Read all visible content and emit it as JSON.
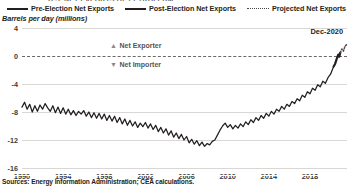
{
  "figure": {
    "unit_label": "Barrels per day (millions)",
    "source_note": "Sources: Energy Information Administration; CEA calculations.",
    "title_sliver": "U.S. NET EXPORTS OF PETROLEUM"
  },
  "legend": {
    "items": [
      {
        "label": "Pre-Election Net Exports",
        "style": "solid-thin",
        "color": "#231f20"
      },
      {
        "label": "Post-Election Net Exports",
        "style": "solid-thick",
        "color": "#231f20"
      },
      {
        "label": "Projected Net Exports",
        "style": "dotted",
        "color": "#4a4745"
      }
    ]
  },
  "annotations": {
    "net_exporter": {
      "marker": "▲",
      "label": "Net Exporter"
    },
    "net_importer": {
      "marker": "▼",
      "label": "Net Importer"
    },
    "date_label": "Dec-2020"
  },
  "chart_data": {
    "type": "line",
    "title": "",
    "xlabel": "",
    "ylabel": "Barrels per day (millions)",
    "xlim": [
      1990,
      2021.6
    ],
    "ylim": [
      -16,
      4
    ],
    "yticks": [
      4,
      0,
      -4,
      -8,
      -12,
      -16
    ],
    "xticks": [
      1990,
      1994,
      1998,
      2002,
      2006,
      2010,
      2014,
      2018
    ],
    "grid": "horizontal",
    "legend_position": "top-center",
    "zero_reference_line": 0,
    "series": [
      {
        "name": "Pre-Election Net Exports",
        "style": "solid",
        "x": [
          1990.0,
          1990.25,
          1990.5,
          1990.75,
          1991.0,
          1991.25,
          1991.5,
          1991.75,
          1992.0,
          1992.25,
          1992.5,
          1992.75,
          1993.0,
          1993.25,
          1993.5,
          1993.75,
          1994.0,
          1994.25,
          1994.5,
          1994.75,
          1995.0,
          1995.25,
          1995.5,
          1995.75,
          1996.0,
          1996.25,
          1996.5,
          1996.75,
          1997.0,
          1997.25,
          1997.5,
          1997.75,
          1998.0,
          1998.25,
          1998.5,
          1998.75,
          1999.0,
          1999.25,
          1999.5,
          1999.75,
          2000.0,
          2000.25,
          2000.5,
          2000.75,
          2001.0,
          2001.25,
          2001.5,
          2001.75,
          2002.0,
          2002.25,
          2002.5,
          2002.75,
          2003.0,
          2003.25,
          2003.5,
          2003.75,
          2004.0,
          2004.25,
          2004.5,
          2004.75,
          2005.0,
          2005.25,
          2005.5,
          2005.75,
          2006.0,
          2006.25,
          2006.5,
          2006.75,
          2007.0,
          2007.25,
          2007.5,
          2007.75,
          2008.0,
          2008.25,
          2008.5,
          2008.75,
          2009.0,
          2009.25,
          2009.5,
          2009.75,
          2010.0,
          2010.25,
          2010.5,
          2010.75,
          2011.0,
          2011.25,
          2011.5,
          2011.75,
          2012.0,
          2012.25,
          2012.5,
          2012.75,
          2013.0,
          2013.25,
          2013.5,
          2013.75,
          2014.0,
          2014.25,
          2014.5,
          2014.75,
          2015.0,
          2015.25,
          2015.5,
          2015.75,
          2016.0,
          2016.25,
          2016.5,
          2016.75,
          2017.0,
          2017.25,
          2017.5,
          2017.75,
          2018.0,
          2018.25,
          2018.5,
          2018.75,
          2019.0,
          2019.25,
          2019.5,
          2019.75,
          2020.0,
          2020.3
        ],
        "y": [
          -7.3,
          -6.6,
          -7.6,
          -6.9,
          -8.0,
          -7.1,
          -7.9,
          -7.0,
          -7.6,
          -6.8,
          -7.4,
          -7.9,
          -7.1,
          -8.1,
          -7.3,
          -8.2,
          -7.4,
          -8.3,
          -7.6,
          -8.4,
          -7.8,
          -8.5,
          -7.9,
          -8.3,
          -7.8,
          -8.6,
          -8.0,
          -8.8,
          -8.1,
          -8.9,
          -8.2,
          -9.0,
          -8.3,
          -9.2,
          -8.5,
          -9.3,
          -8.6,
          -9.5,
          -8.8,
          -9.7,
          -9.0,
          -9.9,
          -9.2,
          -10.0,
          -9.4,
          -10.2,
          -9.6,
          -10.1,
          -9.5,
          -10.3,
          -9.7,
          -10.5,
          -9.9,
          -10.8,
          -10.2,
          -11.0,
          -10.4,
          -11.3,
          -10.7,
          -11.6,
          -11.0,
          -11.8,
          -11.2,
          -12.0,
          -11.5,
          -12.4,
          -11.9,
          -12.6,
          -12.1,
          -12.8,
          -12.3,
          -12.9,
          -12.5,
          -12.7,
          -12.2,
          -12.0,
          -11.3,
          -10.6,
          -10.0,
          -9.6,
          -10.2,
          -9.8,
          -10.4,
          -9.9,
          -10.3,
          -9.7,
          -10.1,
          -9.4,
          -9.8,
          -9.1,
          -9.5,
          -8.8,
          -9.2,
          -8.5,
          -8.9,
          -8.2,
          -8.6,
          -7.9,
          -8.3,
          -7.6,
          -7.9,
          -7.2,
          -7.6,
          -6.9,
          -7.2,
          -6.5,
          -6.8,
          -6.1,
          -6.4,
          -5.6,
          -5.9,
          -5.1,
          -5.4,
          -4.6,
          -4.9,
          -4.1,
          -4.4,
          -3.6,
          -3.9,
          -3.1,
          -2.6,
          -1.5
        ]
      },
      {
        "name": "Post-Election Net Exports",
        "style": "solid",
        "x": [
          2020.3,
          2020.45,
          2020.6,
          2020.75,
          2020.85,
          2020.95
        ],
        "y": [
          -1.5,
          -1.1,
          -0.4,
          0.2,
          -0.1,
          0.5
        ]
      },
      {
        "name": "Projected Net Exports",
        "style": "dotted",
        "x": [
          2020.95,
          2021.1,
          2021.25,
          2021.4,
          2021.55
        ],
        "y": [
          0.5,
          1.0,
          0.7,
          1.4,
          1.6
        ]
      }
    ]
  }
}
